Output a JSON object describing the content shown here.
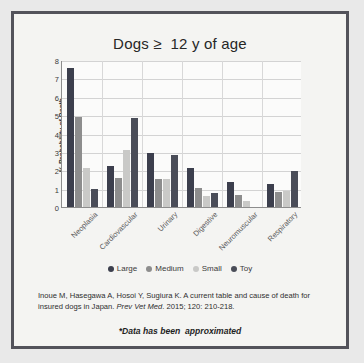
{
  "chart_data": {
    "type": "bar",
    "title": "Dogs ≥  12 y of age",
    "xlabel": "",
    "ylabel": "% Probability of Death",
    "ylim": [
      0,
      8
    ],
    "yticks": [
      0,
      1,
      2,
      3,
      4,
      5,
      6,
      7,
      8
    ],
    "grid": true,
    "legend_position": "bottom",
    "categories": [
      "Neoplasia",
      "Cardiovascular",
      "Urinary",
      "Digestive",
      "Neuromuscular",
      "Respiratory"
    ],
    "series": [
      {
        "name": "Large",
        "color": "#3c3f4d",
        "values": [
          7.55,
          2.25,
          2.95,
          2.15,
          1.35,
          1.25
        ]
      },
      {
        "name": "Medium",
        "color": "#8d8d8d",
        "values": [
          4.9,
          1.6,
          1.55,
          1.05,
          0.65,
          0.8
        ]
      },
      {
        "name": "Small",
        "color": "#c9c9c7",
        "values": [
          2.1,
          3.1,
          1.55,
          0.6,
          0.35,
          0.85
        ]
      },
      {
        "name": "Toy",
        "color": "#4a4d58",
        "values": [
          1.0,
          4.85,
          2.85,
          0.75,
          0.0,
          1.95
        ]
      }
    ],
    "annotations": [
      "Inoue M, Hasegawa A, Hosoi Y, Sugiura K. A current table and cause of death for insured dogs in Japan. Prev Vet Med. 2015; 120: 210-218.",
      "*Data has been  approximated"
    ]
  },
  "citation": {
    "part1": "Inoue M, Hasegawa A, Hosoi Y, Sugiura K. A current table and cause of death for insured dogs in Japan. ",
    "journal": "Prev Vet Med",
    "part2": ". 2015; 120: 210-218."
  },
  "footnote": "*Data has been  approximated",
  "colors": {
    "slide_background": "#e9e9e9",
    "frame_border": "#53535b",
    "panel_background": "#f4f4f2",
    "plot_background": "#fbfbfa",
    "axis": "#8d8d8d",
    "gridline": "#d3d3d3"
  }
}
